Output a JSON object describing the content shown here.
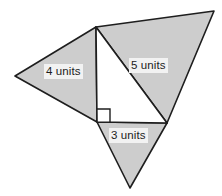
{
  "figure": {
    "name": "composite-triangle-figure",
    "canvas": {
      "width": 222,
      "height": 196
    },
    "colors": {
      "shaded_fill": "#cdcdcd",
      "inner_fill": "#ffffff",
      "stroke": "#1e1e1e",
      "background": "#ffffff",
      "label_text": "#1c1c1c",
      "label_background": "#f2f2f2"
    },
    "stroke_width": 1.6,
    "vertices": {
      "top": [
        96,
        27
      ],
      "left": [
        15,
        76
      ],
      "right_angle": [
        97,
        122
      ],
      "bottom_right": [
        167,
        123
      ],
      "top_right": [
        214,
        11
      ],
      "bottom_apex": [
        130,
        188
      ]
    },
    "shapes": [
      {
        "name": "left-shaded-triangle",
        "points": "96,27 15,76 97,122",
        "fill": "#cdcdcd"
      },
      {
        "name": "right-shaded-triangle",
        "points": "96,27 214,11 167,123",
        "fill": "#cdcdcd"
      },
      {
        "name": "bottom-shaded-triangle",
        "points": "97,122 167,123 130,188",
        "fill": "#cdcdcd"
      },
      {
        "name": "center-right-triangle",
        "points": "96,27 167,123 97,122",
        "fill": "#ffffff"
      }
    ],
    "right_angle_marker": {
      "name": "right-angle-marker",
      "points": "97,109 110,109 110,122",
      "size": 13
    },
    "labels": [
      {
        "id": "label-4units",
        "text": "4 units",
        "side": "hypotenuse-left"
      },
      {
        "id": "label-5units",
        "text": "5 units",
        "side": "hypotenuse-center"
      },
      {
        "id": "label-3units",
        "text": "3 units",
        "side": "base-bottom"
      }
    ]
  }
}
